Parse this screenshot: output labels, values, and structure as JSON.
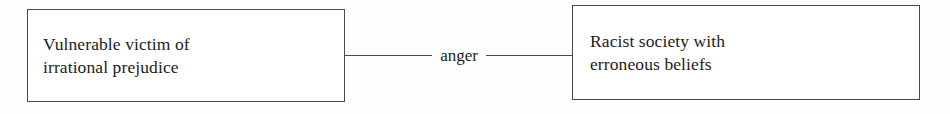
{
  "diagram": {
    "type": "relationship-diagram",
    "nodes": [
      {
        "id": "left",
        "label": "Vulnerable victim of\nirrational prejudice"
      },
      {
        "id": "right",
        "label": "Racist society with\nerroneous beliefs"
      }
    ],
    "edges": [
      {
        "from": "left",
        "to": "right",
        "label": "anger"
      }
    ],
    "colors": {
      "background": "#fefefe",
      "box_fill": "#ffffff",
      "stroke": "#4a4a4a",
      "text": "#1c1c1c"
    }
  }
}
